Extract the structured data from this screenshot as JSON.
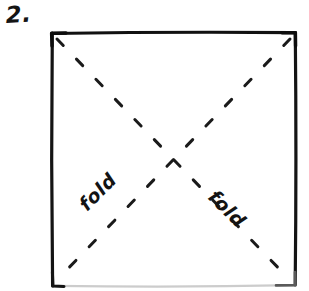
{
  "page": {
    "background_color": "#ffffff",
    "ink_color": "#141414",
    "width": 309,
    "height": 291
  },
  "step": {
    "number_label": "2."
  },
  "figure": {
    "name": "square-sheet-with-diagonal-folds",
    "square": {
      "left": 52,
      "top": 33,
      "right": 295,
      "bottom": 285,
      "stroke_color": "#111111",
      "stroke_width": 3,
      "faint_edge": "bottom",
      "faint_edge_color": "#c9c9c9"
    },
    "diagonals": [
      {
        "name": "diagonal-tl-br",
        "style": "dashed",
        "from": {
          "x": 56,
          "y": 38
        },
        "to": {
          "x": 291,
          "y": 281
        }
      },
      {
        "name": "diagonal-tr-bl",
        "style": "dashed",
        "from": {
          "x": 291,
          "y": 38
        },
        "to": {
          "x": 56,
          "y": 281
        }
      }
    ],
    "intersection": {
      "x": 173,
      "y": 160
    }
  },
  "annotations": [
    {
      "name": "fold-label-left",
      "text": "fold",
      "rotation_deg": -45,
      "on_diagonal": "diagonal-tr-bl"
    },
    {
      "name": "fold-label-right",
      "text": "fold",
      "rotation_deg": 45,
      "on_diagonal": "diagonal-tl-br"
    }
  ]
}
